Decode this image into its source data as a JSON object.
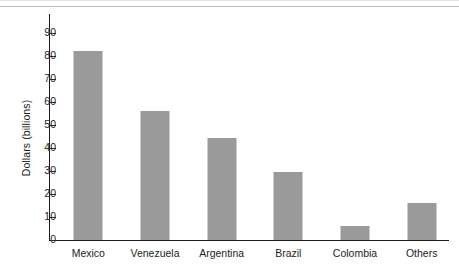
{
  "chart_data": {
    "type": "bar",
    "title": "",
    "subtitle": "",
    "xlabel": "",
    "ylabel": "Dollars (billions)",
    "categories": [
      "Mexico",
      "Venezuela",
      "Argentina",
      "Brazil",
      "Colombia",
      "Others"
    ],
    "values": [
      82,
      56.3,
      44.5,
      29.5,
      6.2,
      16
    ],
    "series": [
      {
        "name": "Dollars (billions)",
        "values": [
          82,
          56.3,
          44.5,
          29.5,
          6.2,
          16
        ]
      }
    ],
    "ylim": [
      0,
      90
    ],
    "ytick_labels": [
      "0",
      "10",
      "20",
      "30",
      "40",
      "50",
      "60",
      "70",
      "80",
      "90"
    ],
    "ytick_values": [
      0,
      10,
      20,
      30,
      40,
      50,
      60,
      70,
      80,
      90
    ],
    "grid": false,
    "legend": false,
    "legend_position": "none",
    "bar_color": "#9a9a9a",
    "axis_color": "#1a1a1a",
    "text_color": "#1d1d1d",
    "background_color": "#ffffff",
    "annotations": []
  }
}
